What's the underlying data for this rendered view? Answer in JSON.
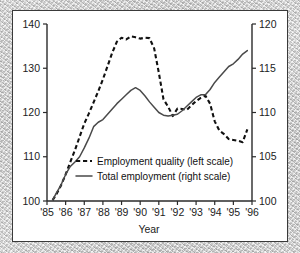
{
  "chart_data": {
    "type": "line",
    "title": "",
    "xlabel": "Year",
    "ylabel": "",
    "grid": false,
    "legend_position": "center",
    "x_tick_labels": [
      "'85",
      "'86",
      "'87",
      "'88",
      "'89",
      "'90",
      "'91",
      "'92",
      "'93",
      "'94",
      "'95",
      "'96"
    ],
    "x_values": [
      1985,
      1986,
      1987,
      1988,
      1989,
      1990,
      1991,
      1992,
      1993,
      1994,
      1995,
      1996
    ],
    "xlim": [
      1985,
      1996
    ],
    "left_axis": {
      "label": "",
      "ylim": [
        100,
        140
      ],
      "ticks": [
        100,
        110,
        120,
        130,
        140
      ],
      "tick_labels": [
        "100",
        "110",
        "120",
        "130",
        "140"
      ]
    },
    "right_axis": {
      "label": "",
      "ylim": [
        100,
        120
      ],
      "ticks": [
        100,
        105,
        110,
        115,
        120
      ],
      "tick_labels": [
        "100",
        "105",
        "110",
        "115",
        "120"
      ]
    },
    "series": [
      {
        "name": "Employment quality (left scale)",
        "axis": "left",
        "style": "dashed",
        "color": "#111111",
        "x": [
          1985.3,
          1985.5,
          1985.75,
          1986.0,
          1986.25,
          1986.5,
          1986.75,
          1987.0,
          1987.25,
          1987.5,
          1987.75,
          1988.0,
          1988.25,
          1988.5,
          1988.75,
          1989.0,
          1989.25,
          1989.5,
          1989.75,
          1990.0,
          1990.25,
          1990.5,
          1990.75,
          1991.0,
          1991.25,
          1991.5,
          1991.75,
          1992.0,
          1992.25,
          1992.5,
          1992.75,
          1993.0,
          1993.25,
          1993.5,
          1993.75,
          1994.0,
          1994.25,
          1994.5,
          1994.75,
          1995.0,
          1995.25,
          1995.5,
          1995.75
        ],
        "values": [
          100.2,
          101.5,
          103.5,
          106.0,
          108.8,
          111.5,
          114.5,
          117.5,
          119.8,
          122.3,
          124.8,
          127.5,
          130.5,
          133.5,
          136.0,
          136.9,
          136.5,
          137.2,
          137.0,
          136.7,
          136.9,
          136.8,
          134.5,
          129.0,
          123.0,
          121.3,
          119.2,
          120.9,
          120.8,
          120.6,
          121.6,
          122.6,
          123.3,
          123.8,
          122.0,
          118.0,
          115.9,
          115.1,
          114.0,
          113.8,
          113.6,
          113.3,
          116.2
        ]
      },
      {
        "name": "Total employment (right scale)",
        "axis": "right",
        "style": "solid",
        "color": "#4a4a4a",
        "x": [
          1985.3,
          1985.5,
          1985.75,
          1986.0,
          1986.25,
          1986.5,
          1986.75,
          1987.0,
          1987.25,
          1987.5,
          1987.75,
          1988.0,
          1988.25,
          1988.5,
          1988.75,
          1989.0,
          1989.25,
          1989.5,
          1989.75,
          1990.0,
          1990.25,
          1990.5,
          1990.75,
          1991.0,
          1991.25,
          1991.5,
          1991.75,
          1992.0,
          1992.25,
          1992.5,
          1992.75,
          1993.0,
          1993.25,
          1993.5,
          1993.75,
          1994.0,
          1994.25,
          1994.5,
          1994.75,
          1995.0,
          1995.25,
          1995.5,
          1995.75
        ],
        "values": [
          100.1,
          100.9,
          101.8,
          103.0,
          103.9,
          104.4,
          105.0,
          106.0,
          107.1,
          108.4,
          108.9,
          109.2,
          109.8,
          110.4,
          111.0,
          111.5,
          112.0,
          112.5,
          112.8,
          112.5,
          111.9,
          111.2,
          110.6,
          110.0,
          109.7,
          109.6,
          109.7,
          109.8,
          110.2,
          110.7,
          111.2,
          111.7,
          112.0,
          112.0,
          112.6,
          113.4,
          114.0,
          114.6,
          115.2,
          115.5,
          116.0,
          116.6,
          117.0
        ]
      }
    ],
    "legend_entries": [
      {
        "label": "Employment quality (left scale)",
        "style": "dashed"
      },
      {
        "label": "Total employment (right scale)",
        "style": "solid"
      }
    ]
  }
}
